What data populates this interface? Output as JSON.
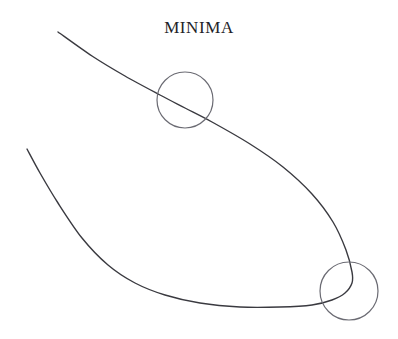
{
  "figure": {
    "title": "MINIMA",
    "background_color": "#ffffff",
    "width": 398,
    "height": 339,
    "title_color": "#232327",
    "title_position": {
      "x": 197,
      "y": 30
    }
  },
  "chart_data": {
    "type": "line",
    "title": "MINIMA",
    "subtitle": "",
    "xlabel": "",
    "ylabel": "",
    "grid": false,
    "legend": null,
    "axes_visible": false,
    "xlim": [
      0,
      398
    ],
    "ylim": [
      0,
      339
    ],
    "curve": {
      "name": "hook-curve",
      "color": "#3a3a40",
      "stroke_width": 1.4,
      "description": "Single continuous smooth curve descending from upper-left, sweeping right and down to a sharp cusp at lower right, then returning leftwards along the bottom and rising to the left edge.",
      "points": [
        [
          58,
          32
        ],
        [
          92,
          56
        ],
        [
          125,
          76
        ],
        [
          160,
          95
        ],
        [
          185,
          108
        ],
        [
          212,
          122
        ],
        [
          250,
          144
        ],
        [
          283,
          167
        ],
        [
          312,
          194
        ],
        [
          333,
          222
        ],
        [
          346,
          250
        ],
        [
          352,
          272
        ],
        [
          352,
          283
        ],
        [
          345,
          293
        ],
        [
          332,
          300
        ],
        [
          312,
          305
        ],
        [
          280,
          307
        ],
        [
          240,
          307
        ],
        [
          200,
          303
        ],
        [
          165,
          295
        ],
        [
          135,
          283
        ],
        [
          108,
          265
        ],
        [
          82,
          238
        ],
        [
          58,
          203
        ],
        [
          40,
          173
        ],
        [
          27,
          149
        ]
      ]
    },
    "annotations": [
      {
        "name": "upper-minimum-circle",
        "shape": "circle",
        "cx": 185,
        "cy": 100,
        "r": 28,
        "stroke": "#6b6b73",
        "stroke_width": 1.2,
        "fill": "none",
        "label": ""
      },
      {
        "name": "lower-minimum-circle",
        "shape": "circle",
        "cx": 349,
        "cy": 291,
        "r": 29,
        "stroke": "#6b6b73",
        "stroke_width": 1.2,
        "fill": "none",
        "label": ""
      }
    ]
  }
}
